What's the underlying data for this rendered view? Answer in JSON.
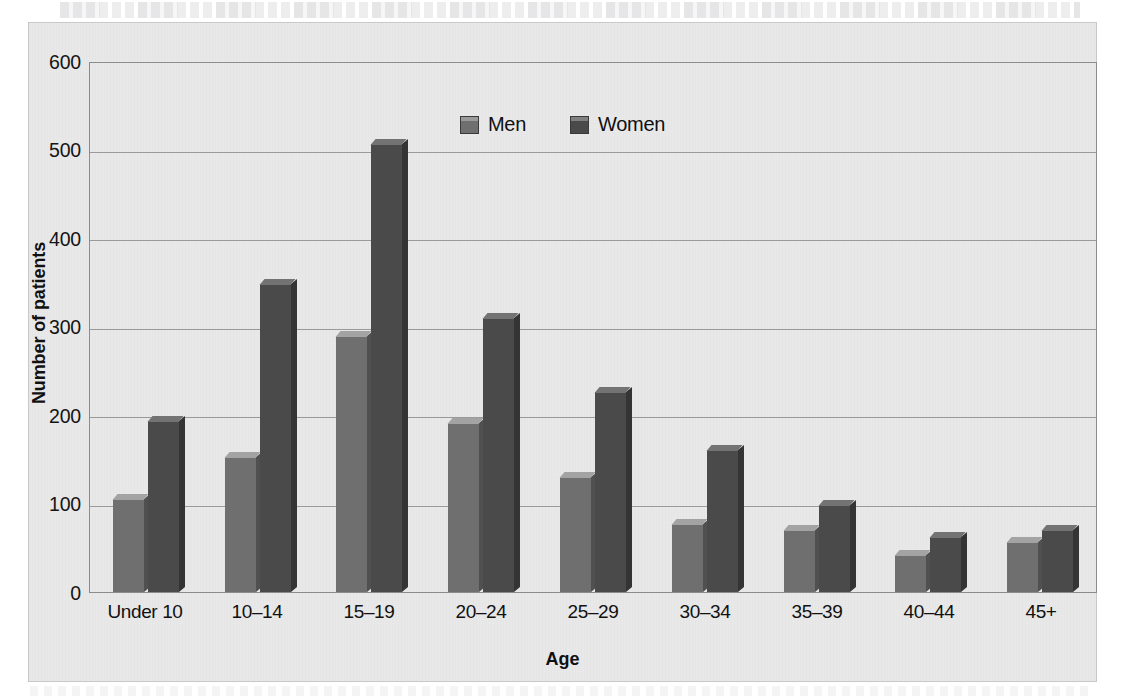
{
  "chart_data": {
    "type": "bar",
    "title": "",
    "xlabel": "Age",
    "ylabel": "Number of patients",
    "categories": [
      "Under 10",
      "10–14",
      "15–19",
      "20–24",
      "25–29",
      "30–34",
      "35–39",
      "40–44",
      "45+"
    ],
    "series": [
      {
        "name": "Men",
        "color": "#6f6f70",
        "values": [
          105,
          153,
          289,
          191,
          130,
          77,
          70,
          42,
          57
        ]
      },
      {
        "name": "Women",
        "color": "#4a4a4b",
        "values": [
          193,
          348,
          506,
          310,
          226,
          161,
          98,
          62,
          70
        ]
      }
    ],
    "ylim": [
      0,
      600
    ],
    "yticks": [
      0,
      100,
      200,
      300,
      400,
      500,
      600
    ],
    "ytick_labels": [
      "0",
      "100",
      "200",
      "300",
      "400",
      "500",
      "600"
    ],
    "grid": "horizontal",
    "legend_position": "top-center",
    "bar_style": "3d"
  },
  "axes": {
    "y_title": "Number of patients",
    "x_title": "Age",
    "y_tick_0": "0",
    "y_tick_100": "100",
    "y_tick_200": "200",
    "y_tick_300": "300",
    "y_tick_400": "400",
    "y_tick_500": "500",
    "y_tick_600": "600"
  },
  "legend": {
    "items": [
      {
        "label": "Men",
        "color": "#6f6f70"
      },
      {
        "label": "Women",
        "color": "#4a4a4b"
      }
    ]
  }
}
